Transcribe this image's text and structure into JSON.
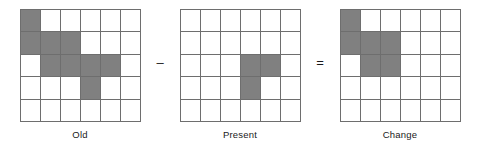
{
  "figure": {
    "type": "grid-arithmetic-diagram",
    "grid_rows": 5,
    "grid_cols": 6,
    "fill_color": "#808080",
    "line_color": "#6e6e6e",
    "background_color": "#ffffff",
    "panels": [
      {
        "caption": "Old",
        "filled_cells": [
          [
            1,
            1
          ],
          [
            2,
            1
          ],
          [
            2,
            2
          ],
          [
            2,
            3
          ],
          [
            3,
            2
          ],
          [
            3,
            3
          ],
          [
            3,
            4
          ],
          [
            3,
            5
          ],
          [
            4,
            4
          ]
        ],
        "filled_count": 9
      },
      {
        "caption": "Present",
        "filled_cells": [
          [
            3,
            4
          ],
          [
            3,
            5
          ],
          [
            4,
            4
          ]
        ],
        "filled_count": 3
      },
      {
        "caption": "Change",
        "filled_cells": [
          [
            1,
            1
          ],
          [
            2,
            1
          ],
          [
            2,
            2
          ],
          [
            2,
            3
          ],
          [
            3,
            2
          ],
          [
            3,
            3
          ]
        ],
        "filled_count": 6
      }
    ],
    "operators": [
      {
        "symbol": "–",
        "name": "minus"
      },
      {
        "symbol": "=",
        "name": "equals"
      }
    ]
  }
}
